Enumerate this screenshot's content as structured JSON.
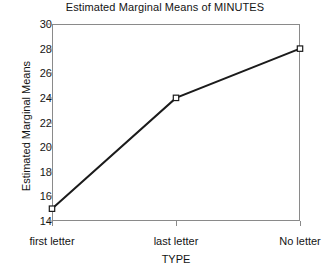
{
  "chart_data": {
    "type": "line",
    "title": "Estimated Marginal Means of MINUTES",
    "xlabel": "TYPE",
    "ylabel": "Estimated Marginal Means",
    "categories": [
      "first letter",
      "last letter",
      "No letter"
    ],
    "values": [
      15,
      24,
      28
    ],
    "series": [
      {
        "name": "Estimated Marginal Means",
        "values": [
          15,
          24,
          28
        ],
        "marker": "open-square",
        "color": "#1b1b1b"
      }
    ],
    "ylim": [
      14,
      30
    ],
    "yticks": [
      14,
      16,
      18,
      20,
      22,
      24,
      26,
      28,
      30
    ],
    "ytick_labels": [
      "14",
      "16",
      "18",
      "20",
      "22",
      "24",
      "26",
      "28",
      "30"
    ],
    "xtick_labels": [
      "first letter",
      "last letter",
      "No letter"
    ],
    "grid": false,
    "legend": false,
    "legend_position": "none",
    "frame": true,
    "line_color": "#1b1b1b",
    "axis_color": "#8a8a8a",
    "background": "#ffffff"
  }
}
